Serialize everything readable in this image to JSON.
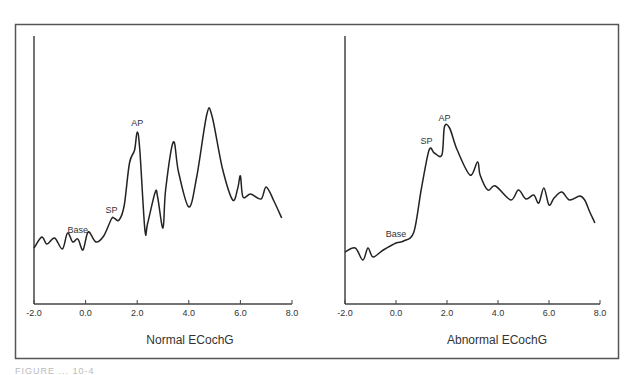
{
  "figure": {
    "caption_fragment": "FIGURE ... 10-4",
    "frame_color": "#555555",
    "line_color": "#222222"
  },
  "chart_data": [
    {
      "type": "line",
      "title": "Normal ECochG",
      "xlabel": "",
      "ylabel": "",
      "x_ticks": [
        "-2.0",
        "0.0",
        "2.0",
        "4.0",
        "6.0",
        "8.0"
      ],
      "xlim": [
        -2.0,
        8.0
      ],
      "grid": false,
      "annotations": [
        {
          "text": "Base",
          "x": -0.3
        },
        {
          "text": "SP",
          "x": 1.0
        },
        {
          "text": "AP",
          "x": 2.0
        }
      ],
      "series": [
        {
          "name": "Normal ECochG",
          "x": [
            -2.0,
            -1.7,
            -1.5,
            -1.2,
            -0.9,
            -0.7,
            -0.5,
            -0.3,
            -0.1,
            0.1,
            0.4,
            0.7,
            1.0,
            1.1,
            1.3,
            1.5,
            1.7,
            1.9,
            2.0,
            2.1,
            2.3,
            2.4,
            2.7,
            2.8,
            3.0,
            3.1,
            3.4,
            3.6,
            4.0,
            4.3,
            4.7,
            4.9,
            5.3,
            5.7,
            5.9,
            6.0,
            6.1,
            6.4,
            6.8,
            7.0,
            7.3,
            7.6
          ],
          "y": [
            56,
            67,
            60,
            66,
            55,
            71,
            62,
            65,
            54,
            72,
            62,
            68,
            85,
            86,
            84,
            99,
            141,
            154,
            172,
            154,
            74,
            80,
            112,
            106,
            76,
            114,
            162,
            132,
            97,
            126,
            190,
            188,
            136,
            104,
            116,
            128,
            107,
            110,
            105,
            117,
            103,
            86
          ]
        }
      ]
    },
    {
      "type": "line",
      "title": "Abnormal ECochG",
      "xlabel": "",
      "ylabel": "",
      "x_ticks": [
        "-2.0",
        "0.0",
        "2.0",
        "4.0",
        "6.0",
        "8.0"
      ],
      "xlim": [
        -2.0,
        8.0
      ],
      "grid": false,
      "annotations": [
        {
          "text": "Base",
          "x": 0.0
        },
        {
          "text": "SP",
          "x": 1.2
        },
        {
          "text": "AP",
          "x": 1.9
        }
      ],
      "series": [
        {
          "name": "Abnormal ECochG",
          "x": [
            -2.0,
            -1.6,
            -1.3,
            -1.1,
            -0.9,
            -0.5,
            0.0,
            0.3,
            0.7,
            1.0,
            1.3,
            1.5,
            1.8,
            1.9,
            2.1,
            2.4,
            2.9,
            3.2,
            3.3,
            3.6,
            3.9,
            4.5,
            4.8,
            5.1,
            5.4,
            5.6,
            5.8,
            6.0,
            6.2,
            6.5,
            6.8,
            7.2,
            7.4,
            7.6,
            7.8
          ],
          "y": [
            52,
            56,
            44,
            56,
            47,
            54,
            61,
            63,
            72,
            116,
            154,
            151,
            149,
            177,
            176,
            154,
            129,
            142,
            129,
            114,
            118,
            104,
            114,
            105,
            109,
            101,
            116,
            99,
            106,
            112,
            104,
            108,
            104,
            92,
            81
          ]
        }
      ]
    }
  ]
}
